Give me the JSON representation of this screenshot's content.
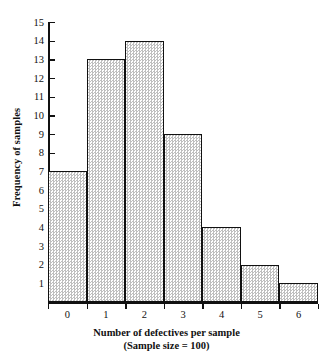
{
  "chart_data": {
    "type": "bar",
    "title": "",
    "subtitle": "",
    "xlabel": "Number of defectives per sample",
    "xlabel_sub": "(Sample size = 100)",
    "ylabel": "Frequency of samples",
    "categories": [
      "0",
      "1",
      "2",
      "3",
      "4",
      "5",
      "6"
    ],
    "values": [
      7,
      13,
      14,
      9,
      4,
      2,
      1
    ],
    "xticklabels": [
      "0",
      "1",
      "2",
      "3",
      "4",
      "5",
      "6"
    ],
    "yticklabels": [
      "1",
      "2",
      "3",
      "4",
      "5",
      "6",
      "7",
      "8",
      "9",
      "10",
      "11",
      "12",
      "13",
      "14",
      "15"
    ],
    "ytickvalues": [
      1,
      2,
      3,
      4,
      5,
      6,
      7,
      8,
      9,
      10,
      11,
      12,
      13,
      14,
      15
    ],
    "ylim": [
      0,
      15
    ],
    "xlim": [
      -0.5,
      6.5
    ],
    "grid": false,
    "legend": null,
    "bar_fill_color": "#e8e8e8",
    "bar_edge_color": "#111111",
    "axis_color": "#111111",
    "background_color": "#ffffff"
  }
}
